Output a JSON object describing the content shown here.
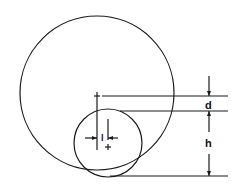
{
  "diagram": {
    "title": "",
    "labels": {
      "d": "d",
      "h": "h",
      "l": "l"
    },
    "colors": {
      "stroke": "#1a1a1a",
      "background": "#ffffff"
    },
    "shapes": {
      "large_circle": {
        "cx": 97,
        "cy": 93,
        "r": 77
      },
      "small_circle": {
        "cx": 108,
        "cy": 143,
        "r": 34
      }
    }
  }
}
